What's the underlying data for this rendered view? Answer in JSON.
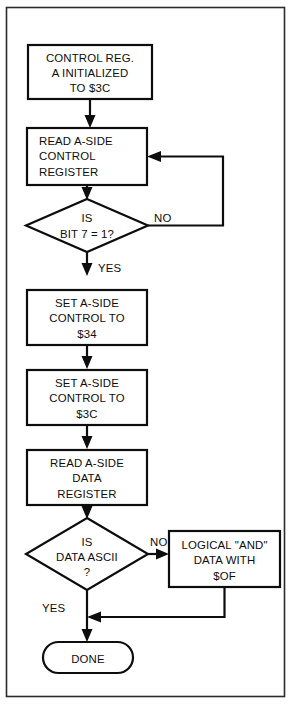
{
  "figure": {
    "type": "flowchart",
    "background_color": "#ffffff",
    "ink_color": "#0d0d0d",
    "frame_color": "#2b2b2b"
  },
  "nodes": {
    "init": {
      "kind": "process",
      "align": "center",
      "lines": [
        "CONTROL REG.",
        "A  INITIALIZED",
        "TO $3C"
      ]
    },
    "read_control": {
      "kind": "process",
      "align": "left",
      "lines": [
        "READ A-SIDE",
        "CONTROL",
        "REGISTER"
      ]
    },
    "bit7": {
      "kind": "decision",
      "align": "center",
      "lines": [
        "IS",
        "BIT 7 = 1?"
      ]
    },
    "set_34": {
      "kind": "process",
      "align": "center",
      "lines": [
        "SET A-SIDE",
        "CONTROL TO",
        "$34"
      ]
    },
    "set_3c": {
      "kind": "process",
      "align": "center",
      "lines": [
        "SET A-SIDE",
        "CONTROL TO",
        "$3C"
      ]
    },
    "read_data": {
      "kind": "process",
      "align": "center",
      "lines": [
        "READ A-SIDE",
        "DATA",
        "REGISTER"
      ]
    },
    "ascii": {
      "kind": "decision",
      "align": "center",
      "lines": [
        "IS",
        "DATA ASCII",
        "?"
      ]
    },
    "logical_and": {
      "kind": "process",
      "align": "center",
      "lines": [
        "LOGICAL \"AND\"",
        "DATA WITH",
        "$OF"
      ]
    },
    "done": {
      "kind": "terminator",
      "align": "center",
      "lines": [
        "DONE"
      ]
    }
  },
  "edge_labels": {
    "bit7_no": "NO",
    "bit7_yes": "YES",
    "ascii_no": "NO",
    "ascii_yes": "YES"
  }
}
